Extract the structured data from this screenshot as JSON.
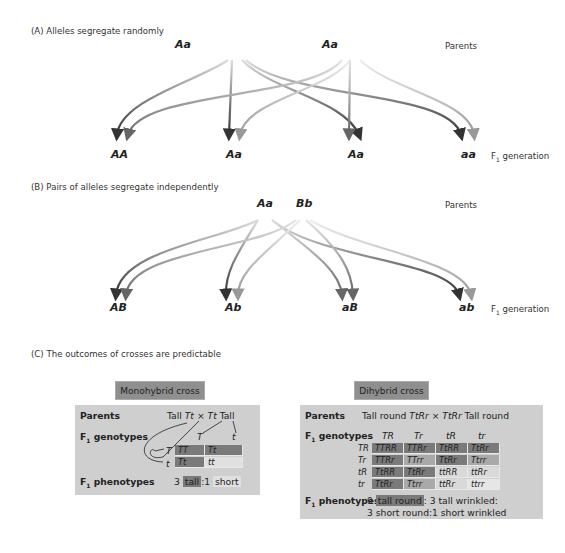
{
  "section_a": {
    "title": "(A) Alleles segregate randomly",
    "parents": [
      "Aa",
      "Aa"
    ],
    "parents_label": "Parents",
    "offspring": [
      "AA",
      "Aa",
      "Aa",
      "aa"
    ],
    "f1_label": "F",
    "f1_sub": "1",
    "f1_suffix": " generation"
  },
  "section_b": {
    "title": "(B) Pairs of alleles segregate independently",
    "parents": [
      "Aa",
      "Bb"
    ],
    "parents_label": "Parents",
    "offspring": [
      "AB",
      "Ab",
      "aB",
      "ab"
    ],
    "f1_label": "F",
    "f1_sub": "1",
    "f1_suffix": " generation"
  },
  "section_c": {
    "title": "(C) The outcomes of crosses are predictable",
    "monohybrid": {
      "tag": "Monohybrid cross",
      "parents_label": "Parents",
      "parents_left": "Tall ",
      "parents_g1": "Tt",
      "parents_x": " × ",
      "parents_g2": "Tt",
      "parents_right": " Tall",
      "genotypes_label_f": "F",
      "genotypes_label_sub": "1",
      "genotypes_label": " genotypes",
      "col_headers": [
        "T",
        "t"
      ],
      "row_headers": [
        "T",
        "t"
      ],
      "cells": [
        [
          "TT",
          "Tt"
        ],
        [
          "Tt",
          "tt"
        ]
      ],
      "phenotypes_label_f": "F",
      "phenotypes_label_sub": "1",
      "phenotypes_label": " phenotypes",
      "ratio_n1": "3 ",
      "ratio_p1": "tall",
      "ratio_sep": ":1 ",
      "ratio_p2": "short"
    },
    "dihybrid": {
      "tag": "Dihybrid cross",
      "parents_label": "Parents",
      "parents_left": "Tall round ",
      "parents_g1": "TtRr",
      "parents_x": " × ",
      "parents_g2": "TtRr",
      "parents_right": " Tall round",
      "genotypes_label_f": "F",
      "genotypes_label_sub": "1",
      "genotypes_label": " genotypes",
      "col_headers": [
        "TR",
        "Tr",
        "tR",
        "tr"
      ],
      "row_headers": [
        "TR",
        "Tr",
        "tR",
        "tr"
      ],
      "cells": [
        [
          "TTRR",
          "TTRr",
          "TtRR",
          "TtRr"
        ],
        [
          "TTRr",
          "TTrr",
          "TtRr",
          "Ttrr"
        ],
        [
          "TtRR",
          "TtRr",
          "ttRR",
          "ttRr"
        ],
        [
          "TtRr",
          "Ttrr",
          "ttRr",
          "ttrr"
        ]
      ],
      "phenotypes_label_f": "F",
      "phenotypes_label_sub": "1",
      "phenotypes_label": " phenotypes",
      "line1_n": "9 ",
      "line1_p1": "tall round",
      "line1_rest": ": 3 tall wrinkled:",
      "line2": "3 short round:1 short wrinkled"
    }
  },
  "colors": {
    "tall_round": "#7a7a7a",
    "tall_wrinkled": "#a9a9a9",
    "short_round": "#d9d9d9",
    "short_wrinkled": "#e6e6e6",
    "panel": "#cfcfcf",
    "tag": "#8f8f8f"
  }
}
